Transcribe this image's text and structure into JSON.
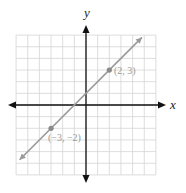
{
  "chart_data": {
    "type": "line",
    "title": "",
    "xlabel": "x",
    "ylabel": "y",
    "xlim": [
      -6,
      6
    ],
    "ylim": [
      -6,
      6
    ],
    "grid": true,
    "grid_step": 1,
    "series": [
      {
        "name": "line",
        "equation": "y = x + 1",
        "color": "#9a9a9a",
        "x": [
          -5.7,
          4.8
        ],
        "y": [
          -4.7,
          5.8
        ]
      }
    ],
    "points": [
      {
        "x": 2,
        "y": 3,
        "label": "(2, 3)"
      },
      {
        "x": -3,
        "y": -2,
        "label": "(−3, −2)"
      }
    ]
  },
  "labels": {
    "x_axis": "x",
    "y_axis": "y",
    "point_a": "(2, 3)",
    "point_b": "(−3, −2)"
  },
  "colors": {
    "grid": "#d4d4d4",
    "axes": "#111111",
    "line": "#9a9a9a",
    "points": "#8a8a8a"
  }
}
